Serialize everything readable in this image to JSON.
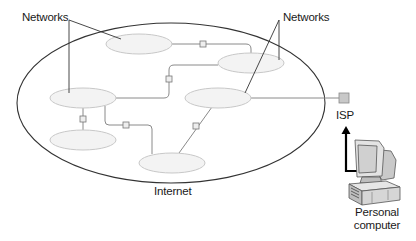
{
  "diagram": {
    "labels": {
      "networks_left": "Networks",
      "networks_right": "Networks",
      "internet": "Internet",
      "isp": "ISP",
      "pc_line1": "Personal",
      "pc_line2": "computer"
    },
    "colors": {
      "network_fill": "#f1f1f1",
      "network_stroke": "#c8c8c8",
      "link_stroke": "#8a8a8a",
      "internet_stroke": "#333333",
      "router_fill": "#eeeeee",
      "isp_fill": "#c8c8c8",
      "arrow": "#000000"
    },
    "networks": [
      {
        "id": "net-top",
        "cx": 139,
        "cy": 43
      },
      {
        "id": "net-top-right",
        "cx": 251,
        "cy": 63
      },
      {
        "id": "net-left",
        "cx": 83,
        "cy": 98
      },
      {
        "id": "net-middle-right",
        "cx": 218,
        "cy": 98
      },
      {
        "id": "net-bottom-left",
        "cx": 83,
        "cy": 140
      },
      {
        "id": "net-bottom",
        "cx": 172,
        "cy": 163
      }
    ]
  }
}
